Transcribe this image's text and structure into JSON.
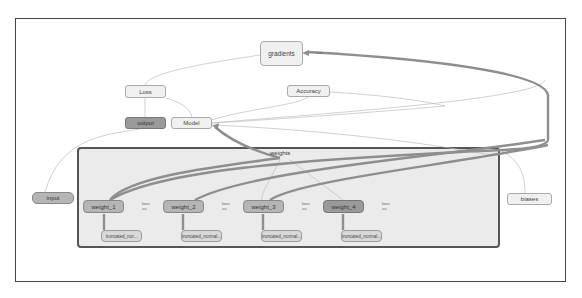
{
  "graph": {
    "nodes": {
      "gradients": "gradients",
      "loss": "Loss",
      "accuracy": "Accuracy",
      "output": "output",
      "model": "Model",
      "input": "input",
      "biases": "biases",
      "weights_group": "weights",
      "weights": [
        "weight_1",
        "weight_2",
        "weight_3",
        "weight_4"
      ],
      "truncated": [
        "truncated_nor...",
        "truncated_normal...",
        "truncated_normal...",
        "truncated_normal..."
      ]
    },
    "port_labels": {
      "gradients_port": "assn",
      "weight_port_top": "bases",
      "weight_port_bottom": "ass"
    }
  }
}
